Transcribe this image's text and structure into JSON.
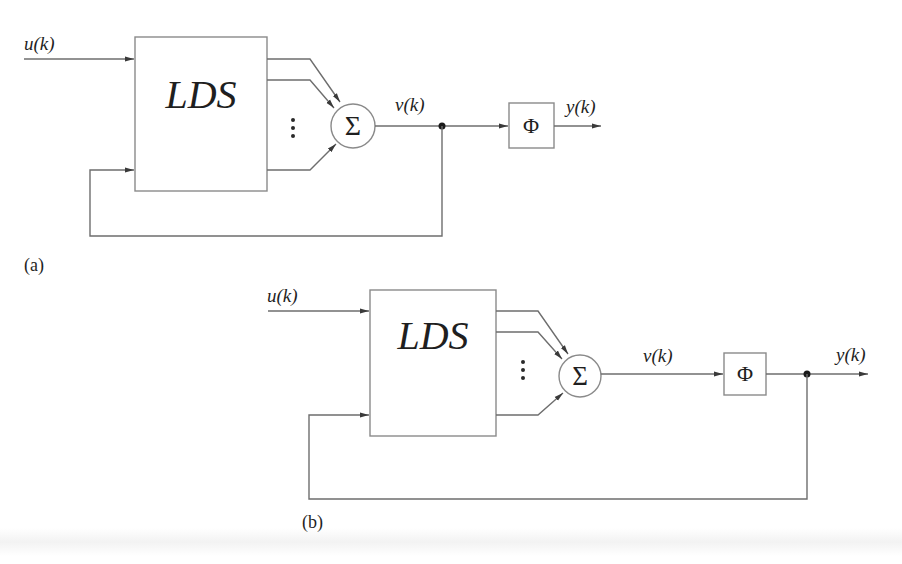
{
  "diagram_a": {
    "panel_label": "(a)",
    "input_label": "u(k)",
    "block_label": "LDS",
    "sum_symbol": "Σ",
    "ellipsis": "⋮",
    "intermediate_label": "v(k)",
    "nonlinearity_symbol": "Φ",
    "output_label": "y(k)",
    "feedback_from": "v(k)"
  },
  "diagram_b": {
    "panel_label": "(b)",
    "input_label": "u(k)",
    "block_label": "LDS",
    "sum_symbol": "Σ",
    "ellipsis": "⋮",
    "intermediate_label": "v(k)",
    "nonlinearity_symbol": "Φ",
    "output_label": "y(k)",
    "feedback_from": "y(k)"
  },
  "colors": {
    "line": "#6e6e6e",
    "text": "#1f1f1f",
    "background": "#ffffff"
  }
}
